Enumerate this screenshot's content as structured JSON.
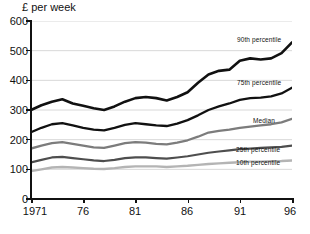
{
  "chart_data": {
    "type": "line",
    "title": "£ per week",
    "xlabel": "",
    "ylabel": "£ per week",
    "ylim": [
      0,
      600
    ],
    "xlim": [
      1971,
      1996
    ],
    "grid": true,
    "legend_position": "inline-right",
    "yticks": [
      0,
      100,
      200,
      300,
      400,
      500,
      600
    ],
    "ytick_labels": [
      "0",
      "100",
      "200",
      "300",
      "400",
      "500",
      "600"
    ],
    "xticks": [
      1971,
      1976,
      1981,
      1986,
      1991,
      1996
    ],
    "xtick_labels": [
      "1971",
      "76",
      "81",
      "86",
      "91",
      "96"
    ],
    "x": [
      1971,
      1972,
      1973,
      1974,
      1975,
      1976,
      1977,
      1978,
      1979,
      1980,
      1981,
      1982,
      1983,
      1984,
      1985,
      1986,
      1987,
      1988,
      1989,
      1990,
      1991,
      1992,
      1993,
      1994,
      1995,
      1996
    ],
    "series": [
      {
        "name": "90th percentile",
        "color": "#111111",
        "width": 2.6,
        "values": [
          300,
          316,
          328,
          336,
          322,
          314,
          306,
          300,
          312,
          328,
          340,
          344,
          340,
          332,
          344,
          360,
          392,
          420,
          432,
          436,
          466,
          474,
          470,
          474,
          492,
          528
        ]
      },
      {
        "name": "75th percentile",
        "color": "#111111",
        "width": 2.3,
        "values": [
          225,
          240,
          252,
          256,
          248,
          240,
          234,
          231,
          240,
          250,
          256,
          252,
          248,
          246,
          254,
          266,
          282,
          300,
          312,
          322,
          334,
          340,
          342,
          346,
          356,
          375
        ]
      },
      {
        "name": "Median",
        "color": "#7c7c7c",
        "width": 2.3,
        "values": [
          170,
          180,
          188,
          192,
          186,
          180,
          174,
          172,
          180,
          188,
          192,
          190,
          186,
          184,
          190,
          198,
          210,
          224,
          230,
          234,
          240,
          244,
          248,
          252,
          258,
          270
        ]
      },
      {
        "name": "25th percentile",
        "color": "#4e4e4e",
        "width": 2.2,
        "values": [
          123,
          132,
          140,
          142,
          138,
          134,
          130,
          128,
          132,
          138,
          140,
          140,
          138,
          136,
          140,
          144,
          150,
          156,
          160,
          164,
          168,
          170,
          172,
          174,
          176,
          180
        ]
      },
      {
        "name": "10th percentile",
        "color": "#b4b4b4",
        "width": 2.4,
        "values": [
          94,
          100,
          106,
          108,
          106,
          104,
          102,
          101,
          104,
          108,
          110,
          110,
          110,
          108,
          110,
          112,
          115,
          118,
          120,
          122,
          124,
          126,
          126,
          127,
          128,
          130
        ]
      }
    ],
    "annotations": [
      {
        "text": "90th percentile",
        "x": 1991,
        "y": 505
      },
      {
        "text": "75th percentile",
        "x": 1991,
        "y": 358
      },
      {
        "text": "Median",
        "x": 1993,
        "y": 252
      },
      {
        "text": "25th percentile",
        "x": 1991,
        "y": 192
      },
      {
        "text": "10th percentile",
        "x": 1991,
        "y": 148
      }
    ]
  },
  "labels": {
    "axis_title": "£ per week",
    "y": [
      "600",
      "500",
      "400",
      "300",
      "200",
      "100",
      "0"
    ],
    "x": [
      "1971",
      "76",
      "81",
      "86",
      "91",
      "96"
    ],
    "s90": "90th percentile",
    "s75": "75th percentile",
    "median": "Median",
    "s25": "25th percentile",
    "s10": "10th percentile"
  }
}
